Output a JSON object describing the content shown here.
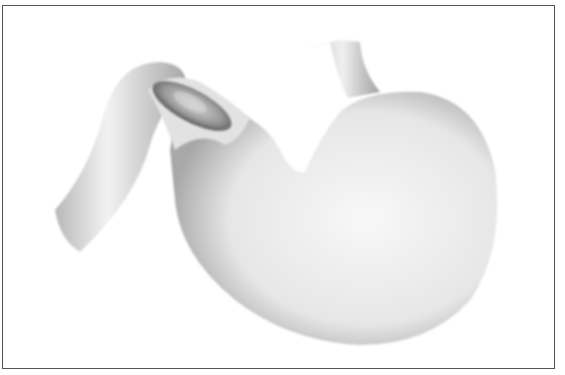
{
  "illustration": {
    "subject": "stomach-with-pyloric-lesion",
    "style": "grayscale",
    "colors": {
      "background": "#ffffff",
      "frame": "#555555",
      "organ_light": "#f4f4f4",
      "organ_shade": "#9a9a9a",
      "lesion_dark": "#555555"
    }
  }
}
